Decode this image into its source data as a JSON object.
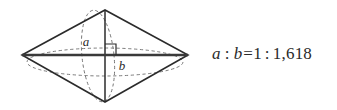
{
  "figure": {
    "background_color": "#ffffff",
    "stroke_color": "#2b2b2b",
    "dash_color": "#6e6e6e",
    "axis_color": "#3a3a3a"
  },
  "diagram": {
    "shape_name": "rhombus-with-inscribed-ellipses",
    "labels": {
      "short_axis": "a",
      "long_axis": "b"
    },
    "right_angle_marker": "right-angle",
    "vertices": {
      "left": [
        22,
        55
      ],
      "top": [
        105,
        10
      ],
      "right": [
        188,
        55
      ],
      "bottom": [
        105,
        102
      ]
    }
  },
  "formula": {
    "left_var": "a",
    "colon_1": ":",
    "right_var": "b",
    "equals": "=",
    "left_value": "1",
    "colon_2": ":",
    "right_value": "1,618",
    "full_text": "a : b=1 : 1,618"
  }
}
